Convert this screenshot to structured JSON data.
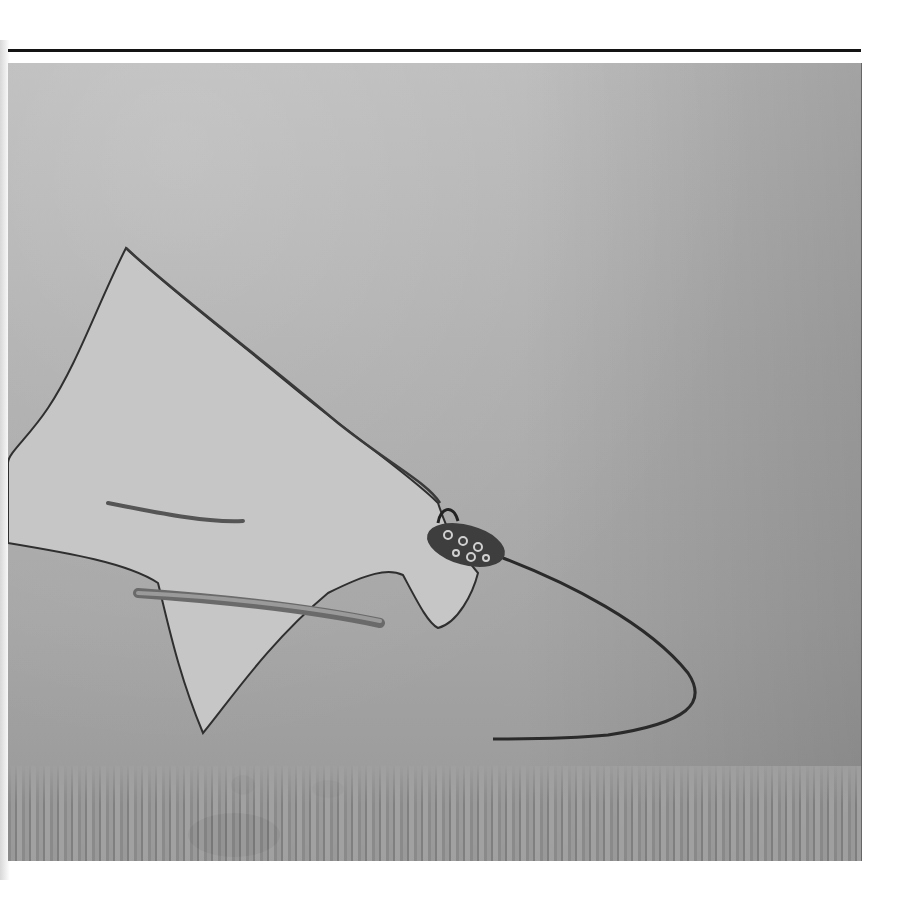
{
  "page": {
    "type": "photograph",
    "colors": {
      "background": "#ffffff",
      "rule": "#141414",
      "water_top": "#b9b9b9",
      "water_bottom": "#8e8e8e",
      "ray_body": "#c4c4c4",
      "ray_outline": "#2a2a2a",
      "head_spots": "#3c3c3c"
    }
  }
}
